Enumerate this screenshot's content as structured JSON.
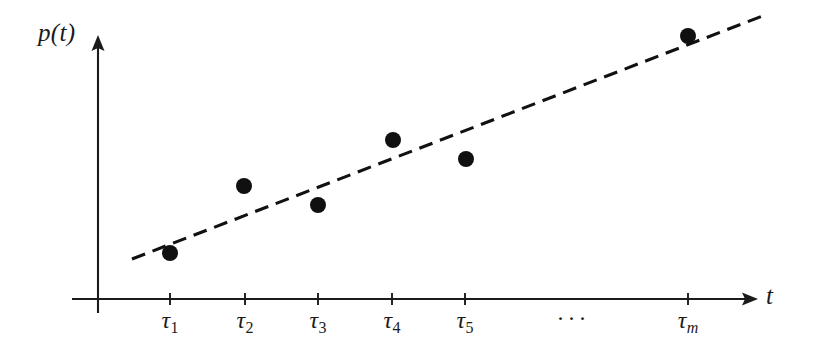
{
  "figure": {
    "background_color": "#ffffff",
    "ink_color": "#1b1b1b",
    "y_axis_label": "p(t)",
    "x_axis_label": "t",
    "ellipsis": "···"
  },
  "axes": {
    "x_axis": {
      "x_start": 72,
      "x_end": 758,
      "y": 299,
      "arrow": true
    },
    "y_axis": {
      "y_start": 35,
      "y_end": 313,
      "x": 98,
      "arrow": true
    }
  },
  "ticks": [
    {
      "label_base": "τ",
      "label_sub": "1",
      "sub_italic": false,
      "x": 170
    },
    {
      "label_base": "τ",
      "label_sub": "2",
      "sub_italic": false,
      "x": 245
    },
    {
      "label_base": "τ",
      "label_sub": "3",
      "sub_italic": false,
      "x": 318
    },
    {
      "label_base": "τ",
      "label_sub": "4",
      "sub_italic": false,
      "x": 392
    },
    {
      "label_base": "τ",
      "label_sub": "5",
      "sub_italic": false,
      "x": 465
    },
    {
      "label_base": "τ",
      "label_sub": "m",
      "sub_italic": true,
      "x": 688
    }
  ],
  "ellipsis_x": 573,
  "chart_data": {
    "type": "scatter",
    "title": "",
    "xlabel": "t",
    "ylabel": "p(t)",
    "grid": false,
    "legend": null,
    "x_tick_labels": [
      "τ₁",
      "τ₂",
      "τ₃",
      "τ₄",
      "τ₅",
      "···",
      "τₘ"
    ],
    "x_tick_pixels": [
      170,
      245,
      318,
      392,
      465,
      573,
      688
    ],
    "points": [
      {
        "label": "τ₁",
        "px": 170,
        "py": 253
      },
      {
        "label": "τ₂",
        "px": 244,
        "py": 186
      },
      {
        "label": "τ₃",
        "px": 318,
        "py": 205
      },
      {
        "label": "τ₄",
        "px": 393,
        "py": 140
      },
      {
        "label": "τ₅",
        "px": 466,
        "py": 159
      },
      {
        "label": "τₘ",
        "px": 688,
        "py": 36
      }
    ],
    "point_radius": 8,
    "trend_line": {
      "style": "dashed",
      "x1": 132,
      "y1": 259,
      "x2": 765,
      "y2": 15,
      "dash": 14,
      "gap": 8
    },
    "note": "Pixel coordinates; y increases downward. Axis values are unlabeled — the figure is schematic, showing an increasing trend of p(t) sampled at times tau_1 .. tau_m with a dashed linear fit."
  }
}
